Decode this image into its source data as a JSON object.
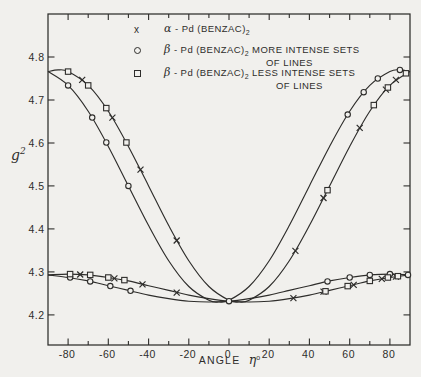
{
  "figure": {
    "background": "#f1f0ed",
    "ink": "#2e2d2b"
  },
  "legend": {
    "items": [
      {
        "symbol": "x",
        "greek": "α",
        "compound": " - Pd (BENZAC)",
        "sub": "2",
        "desc": "",
        "desc2": ""
      },
      {
        "symbol": "circle",
        "greek": "β",
        "compound": " - Pd (BENZAC)",
        "sub": "2",
        "desc": " MORE INTENSE SETS",
        "desc2": "OF LINES"
      },
      {
        "symbol": "square",
        "greek": "β",
        "compound": " - Pd (BENZAC)",
        "sub": "2",
        "desc": " LESS INTENSE SETS",
        "desc2": "OF LINES"
      }
    ]
  },
  "axes": {
    "x": {
      "title": "ANGLE",
      "title_symbol": "η",
      "title_sup": "o",
      "lim": [
        -90,
        90
      ],
      "minor_step": 10,
      "tick_values": [
        -80,
        -60,
        -40,
        -20,
        0,
        20,
        40,
        60,
        80
      ],
      "tick_labels": [
        "-80",
        "-60",
        "-40",
        "-20",
        "0",
        "20",
        "40",
        "60",
        "80"
      ]
    },
    "y": {
      "title": "g",
      "title_sup": "2",
      "lim": [
        4.13,
        4.9
      ],
      "tick_values": [
        4.8,
        4.7,
        4.6,
        4.5,
        4.4,
        4.3,
        4.2
      ],
      "tick_labels": [
        "4.8",
        "4.7",
        "4.6",
        "4.5",
        "4.4",
        "4.3",
        "4.2"
      ]
    }
  },
  "chart_data": {
    "type": "line",
    "title": "",
    "xlabel": "ANGLE η°",
    "ylabel": "g²",
    "xlim": [
      -90,
      90
    ],
    "ylim": [
      4.13,
      4.9
    ],
    "grid": false,
    "legend_position": "top-center-inside",
    "series": [
      {
        "name": "α-Pd (BENZAC)2",
        "marker": "x",
        "upper_points": [
          [
            -73,
            4.747
          ],
          [
            -58,
            4.659
          ],
          [
            -44,
            4.538
          ],
          [
            -26,
            4.373
          ],
          [
            33,
            4.349
          ],
          [
            47,
            4.472
          ],
          [
            65,
            4.635
          ],
          [
            78,
            4.724
          ],
          [
            83,
            4.747
          ]
        ],
        "lower_points": [
          [
            -74,
            4.294
          ],
          [
            -57,
            4.285
          ],
          [
            -43,
            4.271
          ],
          [
            -26,
            4.252
          ],
          [
            32,
            4.239
          ],
          [
            47,
            4.254
          ],
          [
            62,
            4.27
          ],
          [
            76,
            4.284
          ],
          [
            83,
            4.289
          ]
        ]
      },
      {
        "name": "β-Pd (BENZAC)2 MORE INTENSE SETS OF LINES",
        "marker": "circle",
        "upper_points": [
          [
            -80,
            4.734
          ],
          [
            -68,
            4.659
          ],
          [
            -61,
            4.601
          ],
          [
            -50,
            4.5
          ],
          [
            59,
            4.666
          ],
          [
            67,
            4.718
          ],
          [
            74,
            4.75
          ],
          [
            85,
            4.77
          ]
        ],
        "lower_points": [
          [
            -79,
            4.287
          ],
          [
            -69,
            4.278
          ],
          [
            -59,
            4.267
          ],
          [
            -49,
            4.256
          ],
          [
            0,
            4.232
          ],
          [
            49,
            4.278
          ],
          [
            60,
            4.287
          ],
          [
            70,
            4.293
          ],
          [
            80,
            4.295
          ],
          [
            89,
            4.293
          ]
        ]
      },
      {
        "name": "β-Pd (BENZAC)2 LESS INTENSE SETS OF LINES",
        "marker": "square",
        "upper_points": [
          [
            -80,
            4.766
          ],
          [
            -70,
            4.734
          ],
          [
            -61,
            4.681
          ],
          [
            -51,
            4.601
          ],
          [
            49,
            4.49
          ],
          [
            72,
            4.688
          ],
          [
            79,
            4.729
          ],
          [
            88,
            4.762
          ]
        ],
        "lower_points": [
          [
            -79,
            4.295
          ],
          [
            -69,
            4.293
          ],
          [
            -60,
            4.287
          ],
          [
            -52,
            4.281
          ],
          [
            48,
            4.255
          ],
          [
            59,
            4.267
          ],
          [
            70,
            4.279
          ],
          [
            79,
            4.287
          ],
          [
            84,
            4.29
          ]
        ]
      }
    ],
    "curves": [
      {
        "id": "upper-more-intense",
        "points": [
          [
            -90,
            4.766
          ],
          [
            -80,
            4.734
          ],
          [
            -70,
            4.674
          ],
          [
            -60,
            4.592
          ],
          [
            -50,
            4.5
          ],
          [
            -40,
            4.408
          ],
          [
            -30,
            4.326
          ],
          [
            -20,
            4.266
          ],
          [
            -10,
            4.234
          ],
          [
            -5,
            4.23
          ],
          [
            0,
            4.234
          ],
          [
            10,
            4.266
          ],
          [
            20,
            4.326
          ],
          [
            30,
            4.408
          ],
          [
            40,
            4.5
          ],
          [
            50,
            4.592
          ],
          [
            60,
            4.674
          ],
          [
            70,
            4.734
          ],
          [
            80,
            4.766
          ],
          [
            85,
            4.77
          ],
          [
            90,
            4.766
          ]
        ]
      },
      {
        "id": "upper-less-intense",
        "points": [
          [
            -90,
            4.766
          ],
          [
            -85,
            4.77
          ],
          [
            -80,
            4.766
          ],
          [
            -70,
            4.734
          ],
          [
            -60,
            4.674
          ],
          [
            -50,
            4.592
          ],
          [
            -40,
            4.5
          ],
          [
            -30,
            4.408
          ],
          [
            -20,
            4.326
          ],
          [
            -10,
            4.266
          ],
          [
            0,
            4.234
          ],
          [
            5,
            4.23
          ],
          [
            10,
            4.234
          ],
          [
            20,
            4.266
          ],
          [
            30,
            4.326
          ],
          [
            40,
            4.408
          ],
          [
            50,
            4.5
          ],
          [
            60,
            4.592
          ],
          [
            70,
            4.674
          ],
          [
            80,
            4.734
          ],
          [
            90,
            4.766
          ]
        ]
      },
      {
        "id": "lower-more-intense",
        "points": [
          [
            -90,
            4.293
          ],
          [
            -80,
            4.287
          ],
          [
            -70,
            4.279
          ],
          [
            -60,
            4.268
          ],
          [
            -50,
            4.257
          ],
          [
            -40,
            4.246
          ],
          [
            -30,
            4.238
          ],
          [
            -20,
            4.232
          ],
          [
            -10,
            4.23
          ],
          [
            0,
            4.232
          ],
          [
            10,
            4.238
          ],
          [
            20,
            4.246
          ],
          [
            30,
            4.257
          ],
          [
            40,
            4.268
          ],
          [
            50,
            4.279
          ],
          [
            60,
            4.287
          ],
          [
            70,
            4.293
          ],
          [
            80,
            4.295
          ],
          [
            90,
            4.293
          ]
        ]
      },
      {
        "id": "lower-less-intense",
        "points": [
          [
            -90,
            4.293
          ],
          [
            -80,
            4.295
          ],
          [
            -70,
            4.293
          ],
          [
            -60,
            4.287
          ],
          [
            -50,
            4.279
          ],
          [
            -40,
            4.268
          ],
          [
            -30,
            4.257
          ],
          [
            -20,
            4.246
          ],
          [
            -10,
            4.238
          ],
          [
            0,
            4.232
          ],
          [
            10,
            4.23
          ],
          [
            20,
            4.232
          ],
          [
            30,
            4.238
          ],
          [
            40,
            4.246
          ],
          [
            50,
            4.257
          ],
          [
            60,
            4.268
          ],
          [
            70,
            4.279
          ],
          [
            80,
            4.287
          ],
          [
            90,
            4.293
          ]
        ]
      }
    ]
  }
}
